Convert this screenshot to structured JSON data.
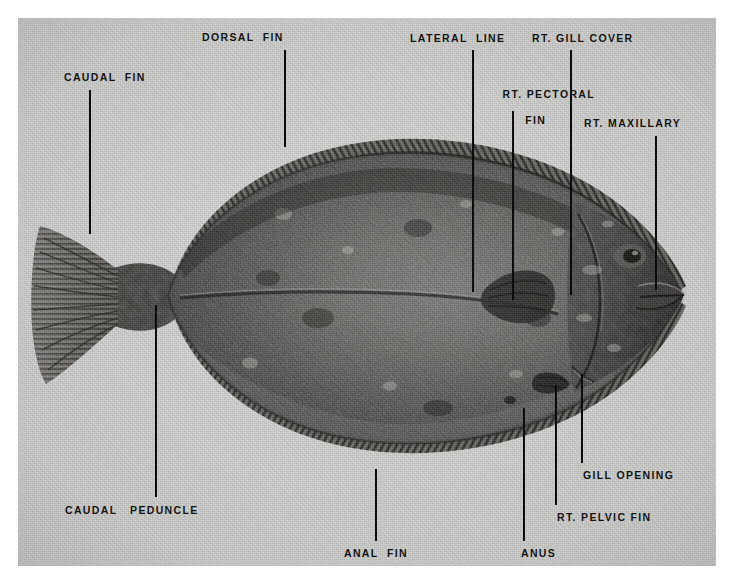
{
  "plate": {
    "kind": "anatomical-photograph",
    "subject": "flatfish (flounder) — right side, eyed side view",
    "background_color": "#d6d7d5",
    "label_color": "#111111",
    "leader_color": "#0c0c0c",
    "margin_color": "#ffffff"
  },
  "labels": [
    {
      "id": "caudal-fin",
      "text": "CAUDAL  FIN"
    },
    {
      "id": "dorsal-fin",
      "text": "DORSAL  FIN"
    },
    {
      "id": "lateral-line",
      "text": "LATERAL  LINE"
    },
    {
      "id": "rt-pectoral-fin-line1",
      "text": "RT. PECTORAL"
    },
    {
      "id": "rt-pectoral-fin-line2",
      "text": "FIN"
    },
    {
      "id": "rt-gill-cover",
      "text": "RT. GILL COVER"
    },
    {
      "id": "rt-maxillary",
      "text": "RT. MAXILLARY"
    },
    {
      "id": "gill-opening",
      "text": "GILL OPENING"
    },
    {
      "id": "rt-pelvic-fin",
      "text": "RT. PELVIC FIN"
    },
    {
      "id": "anus",
      "text": "ANUS"
    },
    {
      "id": "anal-fin",
      "text": "ANAL  FIN"
    },
    {
      "id": "caudal-peduncle",
      "text": "CAUDAL   PEDUNCLE"
    }
  ],
  "callouts": {
    "caudal_fin": {
      "label": "CAUDAL  FIN",
      "label_x": 64,
      "label_y": 71,
      "line_x": 89,
      "line_top": 90,
      "line_bottom": 234
    },
    "dorsal_fin": {
      "label": "DORSAL  FIN",
      "label_x": 202,
      "label_y": 31,
      "line_x": 284,
      "line_top": 50,
      "line_bottom": 147
    },
    "lateral_line": {
      "label": "LATERAL  LINE",
      "label_x": 410,
      "label_y": 32,
      "line_x": 472,
      "line_top": 50,
      "line_bottom": 292
    },
    "rt_pectoral_fin": {
      "label": "RT. PECTORAL",
      "label2": "FIN",
      "label_x": 477,
      "label_y": 75,
      "line_x": 512,
      "line_top": 111,
      "line_bottom": 300
    },
    "rt_gill_cover": {
      "label": "RT. GILL COVER",
      "label_x": 532,
      "label_y": 32,
      "line_x": 570,
      "line_top": 50,
      "line_bottom": 295
    },
    "rt_maxillary": {
      "label": "RT. MAXILLARY",
      "label_x": 584,
      "label_y": 117,
      "line_x": 655,
      "line_top": 136,
      "line_bottom": 290
    },
    "gill_opening": {
      "label": "GILL OPENING",
      "label_x": 583,
      "label_y": 469,
      "line_x": 581,
      "line_top": 374,
      "line_bottom": 463
    },
    "rt_pelvic_fin": {
      "label": "RT. PELVIC FIN",
      "label_x": 557,
      "label_y": 511,
      "line_x": 555,
      "line_top": 385,
      "line_bottom": 505
    },
    "anus": {
      "label": "ANUS",
      "label_x": 521,
      "label_y": 547,
      "line_x": 523,
      "line_top": 408,
      "line_bottom": 541
    },
    "anal_fin": {
      "label": "ANAL  FIN",
      "label_x": 344,
      "label_y": 547,
      "line_x": 375,
      "line_top": 469,
      "line_bottom": 541
    },
    "caudal_peduncle": {
      "label": "CAUDAL   PEDUNCLE",
      "label_x": 65,
      "label_y": 504,
      "line_x": 155,
      "line_top": 305,
      "line_bottom": 497
    }
  }
}
